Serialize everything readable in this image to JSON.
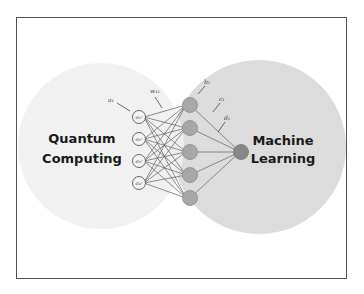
{
  "diagram": {
    "left_region": {
      "line1": "Quantum",
      "line2": "Computing"
    },
    "right_region": {
      "line1": "Machine",
      "line2": "Learning"
    },
    "annotations": {
      "input_label": "a₁",
      "weight_label": "w₁₁",
      "hidden_label": "b₁",
      "c_label": "c₁",
      "d_label": "d₁"
    },
    "input_nodes": [
      "σ₁ᶻ",
      "σ₂ᶻ",
      "σ₃ᶻ",
      "σ₄ᶻ"
    ],
    "hidden_nodes": [
      "h₁",
      "h₂",
      "h₃",
      "h₄",
      "h₅"
    ],
    "output_nodes": 1,
    "colors": {
      "left_circle": "#f0f0f0",
      "right_circle": "#dcdcdc",
      "hidden_node": "#a8a8a8",
      "output_node": "#888888",
      "edge": "#555555",
      "frame": "#555555"
    }
  }
}
